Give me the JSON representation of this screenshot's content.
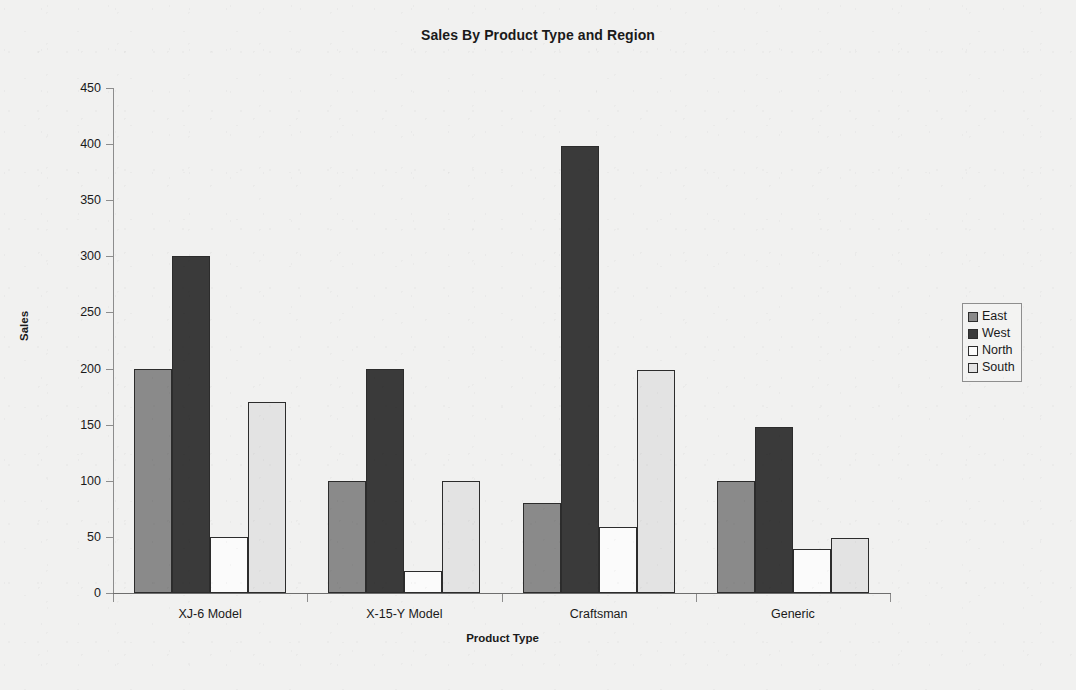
{
  "chart_data": {
    "type": "bar",
    "title": "Sales By Product Type and Region",
    "xlabel": "Product Type",
    "ylabel": "Sales",
    "categories": [
      "XJ-6 Model",
      "X-15-Y Model",
      "Craftsman",
      "Generic"
    ],
    "series": [
      {
        "name": "East",
        "color": "#8a8a8a",
        "values": [
          200,
          100,
          80,
          100
        ]
      },
      {
        "name": "West",
        "color": "#3a3a3a",
        "values": [
          300,
          200,
          398,
          148
        ]
      },
      {
        "name": "North",
        "color": "#fbfbfb",
        "values": [
          50,
          20,
          59,
          39
        ]
      },
      {
        "name": "South",
        "color": "#e3e3e3",
        "values": [
          170,
          100,
          199,
          49
        ]
      }
    ],
    "ylim": [
      0,
      450
    ],
    "yticks": [
      0,
      50,
      100,
      150,
      200,
      250,
      300,
      350,
      400,
      450
    ],
    "ytick_labels": [
      "0",
      "50",
      "100",
      "150",
      "200",
      "250",
      "300",
      "350",
      "400",
      "450"
    ],
    "grid": false,
    "legend_position": "right",
    "legend_entries": [
      "East",
      "West",
      "North",
      "South"
    ],
    "bar_border_color": "#2c2c2c",
    "axis_color": "#8d8d8d",
    "background_color": "#f1f1f0"
  }
}
